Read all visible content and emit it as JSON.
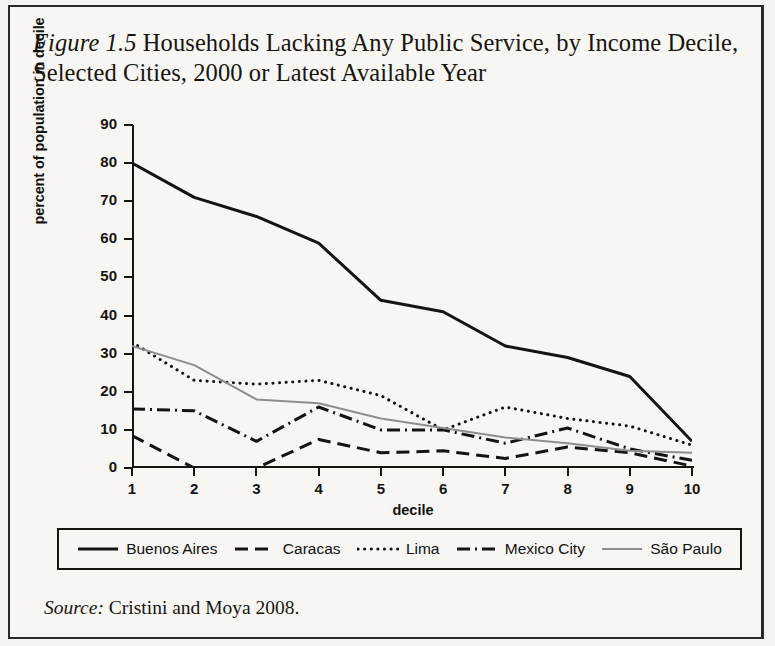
{
  "figure": {
    "number_label": "Figure 1.5",
    "title": "Households Lacking Any Public Service, by Income Decile, Selected Cities, 2000 or Latest Available Year",
    "title_line1": "Households Lacking Any Public Service, by",
    "title_line2": "Income Decile, Selected Cities, 2000 or Latest Available Year"
  },
  "source": {
    "prefix": "Source:",
    "text": "Cristini and Moya 2008."
  },
  "axes": {
    "y_label": "percent of population in decile",
    "x_label": "decile",
    "y_ticks": [
      "0",
      "10",
      "20",
      "30",
      "40",
      "50",
      "60",
      "70",
      "80",
      "90"
    ],
    "x_ticks": [
      "1",
      "2",
      "3",
      "4",
      "5",
      "6",
      "7",
      "8",
      "9",
      "10"
    ]
  },
  "legend": {
    "items": [
      {
        "label": "Buenos Aires",
        "style": "solid",
        "color": "#141414"
      },
      {
        "label": "Caracas",
        "style": "dashed",
        "color": "#141414"
      },
      {
        "label": "Lima",
        "style": "dotted",
        "color": "#141414"
      },
      {
        "label": "Mexico City",
        "style": "dashdot",
        "color": "#141414"
      },
      {
        "label": "São Paulo",
        "style": "solid",
        "color": "#8d8d8d"
      }
    ]
  },
  "chart_data": {
    "type": "line",
    "title": "Figure 1.5 Households Lacking Any Public Service, by Income Decile, Selected Cities, 2000 or Latest Available Year",
    "xlabel": "decile",
    "ylabel": "percent of population in decile",
    "x": [
      1,
      2,
      3,
      4,
      5,
      6,
      7,
      8,
      9,
      10
    ],
    "categories": [
      "1",
      "2",
      "3",
      "4",
      "5",
      "6",
      "7",
      "8",
      "9",
      "10"
    ],
    "ylim": [
      0,
      90
    ],
    "xlim": [
      1,
      10
    ],
    "yticks": [
      0,
      10,
      20,
      30,
      40,
      50,
      60,
      70,
      80,
      90
    ],
    "grid": false,
    "legend_position": "bottom",
    "series": [
      {
        "name": "Buenos Aires",
        "style": "solid",
        "color": "#141414",
        "width": 3,
        "values": [
          80,
          71,
          66,
          59,
          44,
          41,
          32,
          29,
          24,
          7
        ]
      },
      {
        "name": "Caracas",
        "style": "dashed",
        "color": "#141414",
        "width": 3,
        "values": [
          8.5,
          0,
          0,
          7.5,
          4,
          4.5,
          2.5,
          5.5,
          4,
          0.5
        ]
      },
      {
        "name": "Lima",
        "style": "dotted",
        "color": "#141414",
        "width": 3,
        "values": [
          33,
          23,
          22,
          23,
          19,
          10,
          16,
          13,
          11,
          6
        ]
      },
      {
        "name": "Mexico City",
        "style": "dashdot",
        "color": "#141414",
        "width": 3,
        "values": [
          15.5,
          15,
          7,
          16,
          10,
          10,
          6.5,
          10.5,
          5,
          2
        ]
      },
      {
        "name": "São Paulo",
        "style": "solid",
        "color": "#8d8d8d",
        "width": 2,
        "values": [
          32,
          27,
          18,
          17,
          13,
          10.5,
          8,
          6.5,
          4.5,
          4
        ]
      }
    ]
  }
}
